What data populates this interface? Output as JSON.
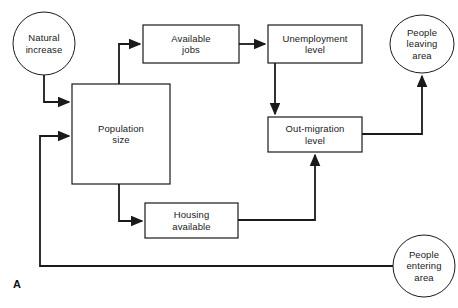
{
  "figure": {
    "letter": "A",
    "stroke_color": "#1a1a1a",
    "fill_color": "#ffffff",
    "background_color": "#ffffff"
  },
  "nodes": [
    {
      "id": "natural-increase",
      "shape": "ellipse",
      "label": "Natural\nincrease",
      "cx": 44,
      "cy": 43.5,
      "rx": 31,
      "ry": 31.5
    },
    {
      "id": "available-jobs",
      "shape": "rect",
      "label": "Available\njobs",
      "x": 143,
      "y": 25,
      "w": 96,
      "h": 38
    },
    {
      "id": "unemployment-level",
      "shape": "rect",
      "label": "Unemployment\nlevel",
      "x": 268,
      "y": 25,
      "w": 94,
      "h": 38
    },
    {
      "id": "people-leaving-area",
      "shape": "ellipse",
      "label": "People\nleaving\narea",
      "cx": 422,
      "cy": 44,
      "rx": 32,
      "ry": 29
    },
    {
      "id": "population-size",
      "shape": "rect",
      "label": "Population\nsize",
      "x": 72,
      "y": 84,
      "w": 98,
      "h": 100
    },
    {
      "id": "out-migration-level",
      "shape": "rect",
      "label": "Out-migration\nlevel",
      "x": 268,
      "y": 117,
      "w": 94,
      "h": 35
    },
    {
      "id": "housing-available",
      "shape": "rect",
      "label": "Housing\navailable",
      "x": 145,
      "y": 203,
      "w": 93,
      "h": 35
    },
    {
      "id": "people-entering-area",
      "shape": "ellipse",
      "label": "People\nentering\narea",
      "cx": 424,
      "cy": 266,
      "rx": 31,
      "ry": 31
    }
  ],
  "edges": [
    {
      "id": "natural-increase-to-population-size",
      "from": "natural-increase",
      "to": "population-size",
      "path": "M 44 75 L 44 102 L 69 102",
      "arrow": true
    },
    {
      "id": "population-size-to-available-jobs",
      "from": "population-size",
      "to": "available-jobs",
      "path": "M 119 84 L 119 44 L 140 44",
      "arrow": true
    },
    {
      "id": "available-jobs-to-unemployment-level",
      "from": "available-jobs",
      "to": "unemployment-level",
      "path": "M 239 44 L 265 44",
      "arrow": true
    },
    {
      "id": "unemployment-level-to-out-migration-level",
      "from": "unemployment-level",
      "to": "out-migration-level",
      "path": "M 275 63 L 275 114",
      "arrow": true
    },
    {
      "id": "out-migration-level-to-people-leaving-area",
      "from": "out-migration-level",
      "to": "people-leaving-area",
      "path": "M 362 134 L 422 134 L 422 76",
      "arrow": true
    },
    {
      "id": "population-size-to-housing-available",
      "from": "population-size",
      "to": "housing-available",
      "path": "M 119 184 L 119 221 L 142 221",
      "arrow": true
    },
    {
      "id": "housing-available-to-out-migration-level",
      "from": "housing-available",
      "to": "out-migration-level",
      "path": "M 238 220 L 315 220 L 315 155",
      "arrow": true
    },
    {
      "id": "people-entering-area-to-population-size",
      "from": "people-entering-area",
      "to": "population-size",
      "path": "M 393 266 L 40 266 L 40 136 L 69 136",
      "arrow": true
    }
  ]
}
